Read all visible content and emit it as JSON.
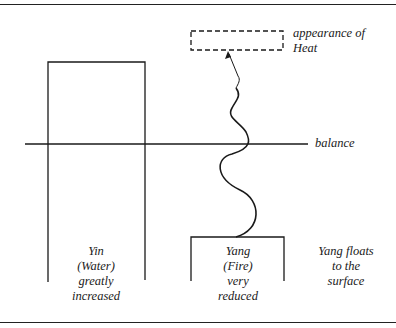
{
  "labels": {
    "heat": [
      "appearance of",
      "Heat"
    ],
    "balance": "balance",
    "yin": [
      "Yin",
      "(Water)",
      "greatly",
      "increased"
    ],
    "yang": [
      "Yang",
      "(Fire)",
      "very",
      "reduced"
    ],
    "yang_floats": [
      "Yang floats",
      "to the",
      "surface"
    ]
  },
  "colors": {
    "stroke": "#1a1a1a",
    "background": "#ffffff"
  }
}
